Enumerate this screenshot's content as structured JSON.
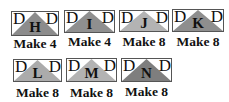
{
  "blocks": [
    {
      "letter": "H",
      "corner_left": "D",
      "corner_right": "D",
      "label": "Make 4",
      "fill": "#8c8c8c"
    },
    {
      "letter": "I",
      "corner_left": "D",
      "corner_right": "D",
      "label": "Make 4",
      "fill": "#8f8f8f"
    },
    {
      "letter": "J",
      "corner_left": "D",
      "corner_right": "D",
      "label": "Make 8",
      "fill": "#b3b3b3"
    },
    {
      "letter": "K",
      "corner_left": "D",
      "corner_right": "D",
      "label": "Make 8",
      "fill": "#8e8e8e"
    },
    {
      "letter": "L",
      "corner_left": "D",
      "corner_right": "D",
      "label": "Make 8",
      "fill": "#ababab"
    },
    {
      "letter": "M",
      "corner_left": "D",
      "corner_right": "D",
      "label": "Make 8",
      "fill": "#b3b3b3"
    },
    {
      "letter": "N",
      "corner_left": "D",
      "corner_right": "D",
      "label": "Make 8",
      "fill": "#7e7e7e"
    }
  ]
}
